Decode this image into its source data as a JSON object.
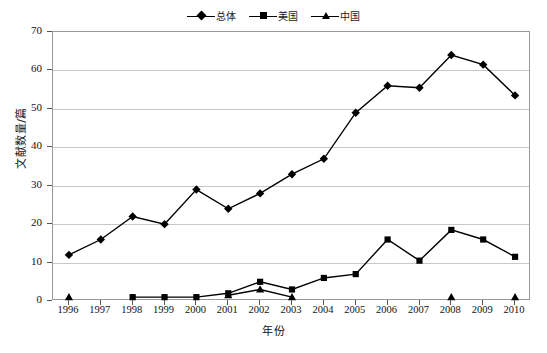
{
  "chart_data": {
    "type": "line",
    "title": "",
    "xlabel": "年份",
    "ylabel": "文献数量/篇",
    "categories": [
      "1996",
      "1997",
      "1998",
      "1999",
      "2000",
      "2001",
      "2002",
      "2003",
      "2004",
      "2005",
      "2006",
      "2007",
      "2008",
      "2009",
      "2010"
    ],
    "x": [
      1996,
      1997,
      1998,
      1999,
      2000,
      2001,
      2002,
      2003,
      2004,
      2005,
      2006,
      2007,
      2008,
      2009,
      2010
    ],
    "ylim": [
      0,
      70
    ],
    "yticks": [
      0,
      10,
      20,
      30,
      40,
      50,
      60,
      70
    ],
    "grid": true,
    "legend_position": "top-center",
    "series": [
      {
        "name": "总体",
        "marker": "diamond",
        "color": "#000000",
        "values": [
          12,
          16,
          22,
          20,
          29,
          24,
          28,
          33,
          37,
          49,
          56,
          55.5,
          64,
          61.5,
          53.5
        ]
      },
      {
        "name": "美国",
        "marker": "square",
        "color": "#000000",
        "values": [
          null,
          null,
          1,
          1,
          1,
          2,
          5,
          3,
          6,
          7,
          16,
          10.5,
          18.5,
          16,
          11.5
        ]
      },
      {
        "name": "中国",
        "marker": "triangle",
        "color": "#000000",
        "values": [
          1,
          null,
          null,
          null,
          null,
          1.5,
          3,
          1,
          null,
          null,
          null,
          null,
          1,
          null,
          1
        ]
      }
    ]
  },
  "axes": {
    "y_tick_labels": [
      "0",
      "10",
      "20",
      "30",
      "40",
      "50",
      "60",
      "70"
    ],
    "x_tick_labels": [
      "1996",
      "1997",
      "1998",
      "1999",
      "2000",
      "2001",
      "2002",
      "2003",
      "2004",
      "2005",
      "2006",
      "2007",
      "2008",
      "2009",
      "2010"
    ],
    "y_axis_title": "文献数量/篇",
    "x_axis_title": "年份"
  },
  "legend": {
    "items": [
      {
        "label": "总体",
        "marker": "diamond"
      },
      {
        "label": "美国",
        "marker": "square"
      },
      {
        "label": "中国",
        "marker": "triangle"
      }
    ]
  },
  "caption": {
    "text": ""
  }
}
